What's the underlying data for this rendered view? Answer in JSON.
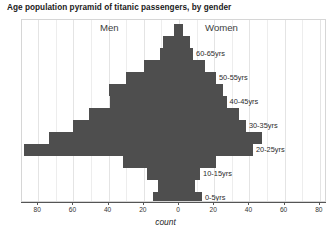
{
  "chart_data": {
    "type": "bar",
    "subtype": "population-pyramid",
    "title": "Age population pyramid of titanic passengers, by gender",
    "xlabel": "count",
    "ylabel": "",
    "xlim": [
      -88,
      88
    ],
    "xticks": [
      80,
      60,
      40,
      20,
      0,
      20,
      40,
      60,
      80
    ],
    "xtick_labels": [
      "80",
      "60",
      "40",
      "20",
      "0",
      "20",
      "40",
      "60",
      "80"
    ],
    "grid": true,
    "legend": "none",
    "bar_color": "#4e4e4e",
    "groups": [
      "Men",
      "Women"
    ],
    "categories": [
      "70-75yrs",
      "65-70yrs",
      "60-65yrs",
      "55-60yrs",
      "50-55yrs",
      "45-50yrs",
      "40-45yrs",
      "35-40yrs",
      "30-35yrs",
      "25-30yrs",
      "20-25yrs",
      "15-20yrs",
      "10-15yrs",
      "5-10yrs",
      "0-5yrs"
    ],
    "visible_category_labels": [
      "60-65yrs",
      "50-55yrs",
      "40-45yrs",
      "30-35yrs",
      "20-25yrs",
      "10-15yrs",
      "0-5yrs"
    ],
    "series": [
      {
        "name": "Men",
        "values": [
          3,
          9,
          11,
          20,
          30,
          40,
          39,
          51,
          60,
          74,
          88,
          32,
          18,
          12,
          15
        ]
      },
      {
        "name": "Women",
        "values": [
          2,
          6,
          8,
          15,
          21,
          25,
          27,
          34,
          38,
          47,
          42,
          21,
          12,
          9,
          13
        ]
      }
    ]
  }
}
